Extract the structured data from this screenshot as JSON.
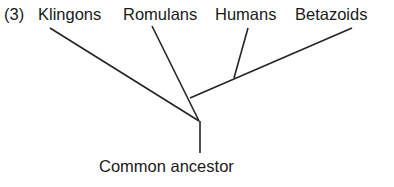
{
  "figure": {
    "number_label": "(3)",
    "root_label": "Common ancestor",
    "background_color": "#ffffff",
    "line_color": "#242424",
    "text_color": "#1a1a1a",
    "taxa": [
      {
        "label": "Klingons"
      },
      {
        "label": "Romulans"
      },
      {
        "label": "Humans"
      },
      {
        "label": "Betazoids"
      }
    ]
  },
  "chart_data": {
    "type": "diagram",
    "diagram_kind": "phylogenetic-tree",
    "title": "(3)",
    "tip_labels": [
      "Klingons",
      "Romulans",
      "Humans",
      "Betazoids"
    ],
    "root_label": "Common ancestor",
    "orientation": "tips-at-top",
    "branch_style": "straight-unrooted-cladogram",
    "nodes": [
      {
        "id": "tip_klingons",
        "label": "Klingons",
        "x": 50,
        "y": 28
      },
      {
        "id": "tip_romulans",
        "label": "Romulans",
        "x": 152,
        "y": 26
      },
      {
        "id": "tip_humans",
        "label": "Humans",
        "x": 248,
        "y": 28
      },
      {
        "id": "tip_betazoids",
        "label": "Betazoids",
        "x": 352,
        "y": 28
      },
      {
        "id": "node_humans_betazoids",
        "label": "",
        "x": 234,
        "y": 78
      },
      {
        "id": "node_upper",
        "label": "",
        "x": 190,
        "y": 98
      },
      {
        "id": "node_root",
        "label": "",
        "x": 199,
        "y": 121
      },
      {
        "id": "root_base",
        "label": "Common ancestor",
        "x": 200,
        "y": 153
      }
    ],
    "edges": [
      {
        "from": "tip_klingons",
        "to": "node_root",
        "x1": 50,
        "y1": 28,
        "x2": 199,
        "y2": 121
      },
      {
        "from": "tip_romulans",
        "to": "node_root",
        "x1": 152,
        "y1": 26,
        "x2": 199,
        "y2": 121
      },
      {
        "from": "tip_humans",
        "to": "node_humans_betazoids",
        "x1": 248,
        "y1": 28,
        "x2": 234,
        "y2": 78
      },
      {
        "from": "tip_betazoids",
        "to": "node_upper",
        "x1": 352,
        "y1": 28,
        "x2": 190,
        "y2": 98
      },
      {
        "from": "node_root",
        "to": "root_base",
        "x1": 200,
        "y1": 121,
        "x2": 200,
        "y2": 153
      }
    ],
    "grid": false,
    "legend": null,
    "xlabel": "",
    "ylabel": ""
  }
}
